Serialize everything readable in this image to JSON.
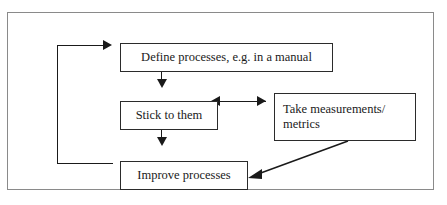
{
  "diagram": {
    "frame": {
      "border_color": "#8a8a8a"
    },
    "box_border_color": "#2b2b2b",
    "connector_color": "#1a1a1a",
    "boxes": [
      {
        "id": "define",
        "label": "Define processes, e.g. in a manual"
      },
      {
        "id": "stick",
        "label": "Stick to them"
      },
      {
        "id": "measure",
        "label": "Take measurements/\nmetrics"
      },
      {
        "id": "improve",
        "label": "Improve processes"
      }
    ],
    "connectors": [
      {
        "id": "define-to-stick",
        "from": "define",
        "to": "stick",
        "style": "vertical",
        "heads": "one"
      },
      {
        "id": "stick-to-improve",
        "from": "stick",
        "to": "improve",
        "style": "vertical",
        "heads": "one"
      },
      {
        "id": "stick-measure",
        "from": "stick",
        "to": "measure",
        "style": "horizontal",
        "heads": "both"
      },
      {
        "id": "measure-to-improve",
        "from": "measure",
        "to": "improve",
        "style": "diagonal",
        "heads": "one"
      },
      {
        "id": "improve-to-define",
        "from": "improve",
        "to": "define",
        "style": "loop-left",
        "heads": "one"
      }
    ],
    "caption": ""
  }
}
